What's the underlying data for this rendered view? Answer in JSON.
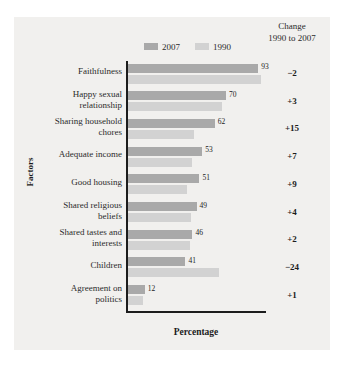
{
  "chart_data": {
    "type": "bar",
    "orientation": "horizontal",
    "title": "",
    "xlabel": "Percentage",
    "ylabel": "Factors",
    "grid": false,
    "legend_position": "top-center",
    "xlim": [
      0,
      100
    ],
    "categories": [
      "Faithfulness",
      "Happy sexual relationship",
      "Sharing household chores",
      "Adequate income",
      "Good housing",
      "Shared religious beliefs",
      "Shared tastes and interests",
      "Children",
      "Agreement on politics"
    ],
    "series": [
      {
        "name": "2007",
        "color": "#a9a9a9",
        "values": [
          93,
          70,
          62,
          53,
          51,
          49,
          46,
          41,
          12
        ]
      },
      {
        "name": "1990",
        "color": "#d2d2d2",
        "values": [
          95,
          67,
          47,
          46,
          42,
          45,
          44,
          65,
          11
        ]
      }
    ],
    "extra_column": {
      "header_line1": "Change",
      "header_line2": "1990 to 2007",
      "values": [
        "−2",
        "+3",
        "+15",
        "+7",
        "+9",
        "+4",
        "+2",
        "−24",
        "+1"
      ]
    },
    "data_labels": [
      "93",
      "70",
      "62",
      "53",
      "51",
      "49",
      "46",
      "41",
      "12"
    ]
  },
  "legend": {
    "items": [
      {
        "label": "2007",
        "color": "#a9a9a9"
      },
      {
        "label": "1990",
        "color": "#d2d2d2"
      }
    ]
  },
  "axes": {
    "x_title": "Percentage",
    "y_title": "Factors"
  },
  "category_labels": [
    "Faithfulness",
    "Happy sexual<br>relationship",
    "Sharing household<br>chores",
    "Adequate income",
    "Good housing",
    "Shared religious<br>beliefs",
    "Shared tastes and<br>interests",
    "Children",
    "Agreement on<br>politics"
  ]
}
